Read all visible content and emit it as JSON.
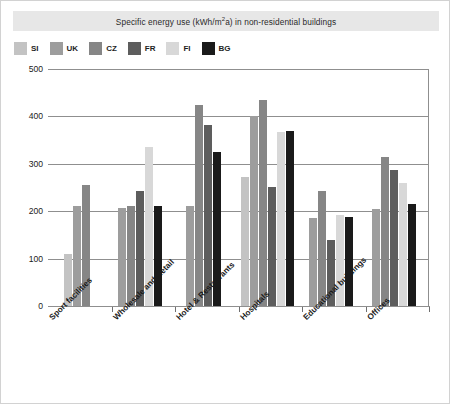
{
  "chart_data": {
    "type": "bar",
    "title_main": "Specific energy use (kWh/m",
    "title_sup": "2",
    "title_tail": "a) in non-residential  buildings",
    "xlabel": "",
    "ylabel": "",
    "ylim": [
      0,
      500
    ],
    "yticks": [
      0,
      100,
      200,
      300,
      400,
      500
    ],
    "grid": true,
    "legend_position": "top-left",
    "categories": [
      "Sport facilities",
      "Wholesale and Retail",
      "Hotel & Restaurants",
      "Hospitals",
      "Educational buildings",
      "Offices"
    ],
    "series": [
      {
        "name": "SI",
        "color": "#c3c3c3",
        "values": [
          110,
          null,
          null,
          272,
          null,
          null
        ]
      },
      {
        "name": "UK",
        "color": "#9d9d9d",
        "values": [
          210,
          207,
          211,
          401,
          186,
          205
        ]
      },
      {
        "name": "CZ",
        "color": "#868686",
        "values": [
          255,
          211,
          425,
          434,
          243,
          314
        ]
      },
      {
        "name": "FR",
        "color": "#5d5d5d",
        "values": [
          null,
          243,
          381,
          252,
          140,
          288
        ]
      },
      {
        "name": "FI",
        "color": "#d8d8d8",
        "values": [
          null,
          335,
          null,
          367,
          192,
          259
        ]
      },
      {
        "name": "BG",
        "color": "#1a1a1a",
        "values": [
          null,
          211,
          325,
          370,
          188,
          216
        ]
      }
    ]
  },
  "legend": {
    "items": [
      {
        "label": "SI",
        "color": "#c3c3c3"
      },
      {
        "label": "UK",
        "color": "#9d9d9d"
      },
      {
        "label": "CZ",
        "color": "#868686"
      },
      {
        "label": "FR",
        "color": "#5d5d5d"
      },
      {
        "label": "FI",
        "color": "#d8d8d8"
      },
      {
        "label": "BG",
        "color": "#1a1a1a"
      }
    ]
  },
  "colors": {
    "grid": "#8f8f8f",
    "title_band": "#e7e7e7",
    "card_border": "#d2d2d2",
    "text": "#1b1b1b"
  }
}
